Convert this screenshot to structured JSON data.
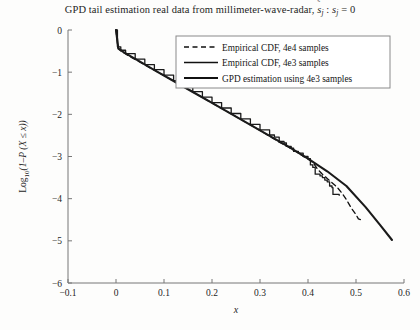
{
  "chart_data": {
    "type": "line",
    "title_parts": {
      "main": "GPD tail estimation real data from millimeter-wave-radar,",
      "hat_symbol": "˜",
      "s_hat": "s",
      "s_hat_sub": "j",
      "colon": " : ",
      "s_plain": "s",
      "s_plain_sub": "j",
      "equals": " = 0"
    },
    "xlabel": "x",
    "ylabel": "Log10(1−P(X ≤ x))",
    "ylabel_parts": {
      "prefix": "Log",
      "sub": "10",
      "suffix": "(1–P (X ≤ x))"
    },
    "xlim": [
      -0.1,
      0.6
    ],
    "ylim": [
      -6,
      0
    ],
    "xticks": [
      -0.1,
      0,
      0.1,
      0.2,
      0.3,
      0.4,
      0.5,
      0.6
    ],
    "xticklabels": [
      "−0.1",
      "0",
      "0.1",
      "0.2",
      "0.3",
      "0.4",
      "0.5",
      "0.6"
    ],
    "yticks": [
      0,
      -1,
      -2,
      -3,
      -4,
      -5,
      -6
    ],
    "yticklabels": [
      "0",
      "−1",
      "−2",
      "−3",
      "−4",
      "−5",
      "−6"
    ],
    "grid": false,
    "legend_position": "upper right",
    "series": [
      {
        "name": "Empirical CDF, 4e4 samples",
        "style": "dashed",
        "color": "#111111",
        "width": 1.3,
        "points": [
          [
            0.0,
            0.0
          ],
          [
            0.004,
            -0.42
          ],
          [
            0.01,
            -0.5
          ],
          [
            0.02,
            -0.57
          ],
          [
            0.04,
            -0.7
          ],
          [
            0.06,
            -0.83
          ],
          [
            0.08,
            -0.95
          ],
          [
            0.1,
            -1.08
          ],
          [
            0.12,
            -1.21
          ],
          [
            0.14,
            -1.34
          ],
          [
            0.16,
            -1.47
          ],
          [
            0.18,
            -1.6
          ],
          [
            0.2,
            -1.73
          ],
          [
            0.22,
            -1.86
          ],
          [
            0.24,
            -1.99
          ],
          [
            0.26,
            -2.12
          ],
          [
            0.28,
            -2.25
          ],
          [
            0.3,
            -2.38
          ],
          [
            0.32,
            -2.52
          ],
          [
            0.34,
            -2.66
          ],
          [
            0.36,
            -2.78
          ],
          [
            0.38,
            -2.92
          ],
          [
            0.4,
            -3.06
          ],
          [
            0.41,
            -3.14
          ],
          [
            0.42,
            -3.3
          ],
          [
            0.43,
            -3.42
          ],
          [
            0.44,
            -3.52
          ],
          [
            0.45,
            -3.62
          ],
          [
            0.46,
            -3.72
          ],
          [
            0.47,
            -3.86
          ],
          [
            0.48,
            -4.02
          ],
          [
            0.49,
            -4.22
          ],
          [
            0.5,
            -4.38
          ],
          [
            0.505,
            -4.48
          ],
          [
            0.51,
            -4.5
          ]
        ]
      },
      {
        "name": "Empirical CDF, 4e3 samples",
        "style": "solid-step",
        "color": "#1a1a1a",
        "width": 1.3,
        "points": [
          [
            0.0,
            0.0
          ],
          [
            0.003,
            -0.4
          ],
          [
            0.01,
            -0.48
          ],
          [
            0.02,
            -0.56
          ],
          [
            0.04,
            -0.69
          ],
          [
            0.06,
            -0.82
          ],
          [
            0.08,
            -0.94
          ],
          [
            0.1,
            -1.07
          ],
          [
            0.12,
            -1.2
          ],
          [
            0.14,
            -1.33
          ],
          [
            0.16,
            -1.46
          ],
          [
            0.18,
            -1.59
          ],
          [
            0.2,
            -1.72
          ],
          [
            0.22,
            -1.85
          ],
          [
            0.24,
            -1.98
          ],
          [
            0.26,
            -2.11
          ],
          [
            0.28,
            -2.24
          ],
          [
            0.3,
            -2.37
          ],
          [
            0.32,
            -2.49
          ],
          [
            0.33,
            -2.54
          ],
          [
            0.34,
            -2.64
          ],
          [
            0.35,
            -2.68
          ],
          [
            0.355,
            -2.76
          ],
          [
            0.365,
            -2.8
          ],
          [
            0.37,
            -2.88
          ],
          [
            0.38,
            -2.92
          ],
          [
            0.39,
            -3.0
          ],
          [
            0.4,
            -3.05
          ],
          [
            0.405,
            -3.2
          ],
          [
            0.41,
            -3.26
          ],
          [
            0.415,
            -3.42
          ],
          [
            0.425,
            -3.46
          ],
          [
            0.43,
            -3.5
          ],
          [
            0.435,
            -3.56
          ],
          [
            0.44,
            -3.6
          ],
          [
            0.445,
            -3.7
          ],
          [
            0.45,
            -3.74
          ],
          [
            0.452,
            -3.9
          ],
          [
            0.465,
            -3.92
          ]
        ]
      },
      {
        "name": "GPD estimation using 4e3 samples",
        "style": "solid-thick",
        "color": "#1a1a1a",
        "width": 2.1,
        "points": [
          [
            0.0,
            0.0
          ],
          [
            0.005,
            -0.44
          ],
          [
            0.015,
            -0.52
          ],
          [
            0.03,
            -0.62
          ],
          [
            0.05,
            -0.75
          ],
          [
            0.08,
            -0.95
          ],
          [
            0.12,
            -1.21
          ],
          [
            0.16,
            -1.47
          ],
          [
            0.2,
            -1.73
          ],
          [
            0.24,
            -1.99
          ],
          [
            0.28,
            -2.25
          ],
          [
            0.32,
            -2.51
          ],
          [
            0.36,
            -2.77
          ],
          [
            0.4,
            -3.05
          ],
          [
            0.44,
            -3.35
          ],
          [
            0.48,
            -3.7
          ],
          [
            0.52,
            -4.2
          ],
          [
            0.55,
            -4.62
          ],
          [
            0.575,
            -4.98
          ]
        ]
      }
    ],
    "legend_entries": [
      {
        "label": "Empirical CDF, 4e4 samples",
        "style": "dashed"
      },
      {
        "label": "Empirical CDF, 4e3 samples",
        "style": "solid"
      },
      {
        "label": "GPD estimation using 4e3 samples",
        "style": "solid-thick"
      }
    ]
  }
}
